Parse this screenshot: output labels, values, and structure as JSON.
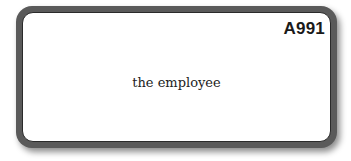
{
  "card": {
    "id_label": "A991",
    "text": "the employee"
  }
}
